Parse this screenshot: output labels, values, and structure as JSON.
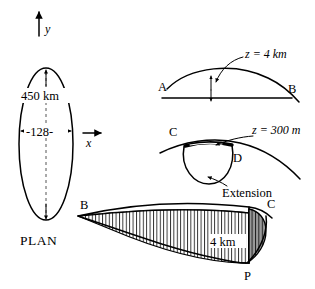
{
  "figure": {
    "background_color": "#ffffff",
    "line_color": "#000000",
    "shade_color": "#8c8c8c"
  },
  "axes": {
    "y_label": "y",
    "x_label": "x",
    "y_arrow_name": "y-axis-arrow",
    "x_arrow_name": "x-axis-arrow"
  },
  "plan_panel": {
    "caption": "PLAN",
    "vertical_dimension": "450 km",
    "horizontal_dimension": "-128-",
    "shape": "ellipse"
  },
  "arch_panel": {
    "left_label": "A",
    "right_label": "B",
    "depth_label": "z = 4 km",
    "annotation_arrow": "curved-pointer"
  },
  "basin_panel": {
    "left_label": "C",
    "right_label": "D",
    "depth_label": "z = 300 m",
    "feature_label": "Extension",
    "annotation_arrow": "curved-pointer"
  },
  "wedge_panel": {
    "left_label": "B",
    "right_label": "C",
    "bottom_label": "P",
    "thickness_label": "4 km",
    "hatching": "vertical-lines"
  }
}
